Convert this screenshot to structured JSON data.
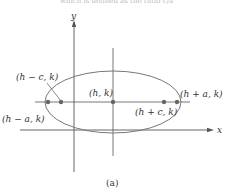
{
  "figure": {
    "top_text": "which is defined as the ratio c/a",
    "caption": "(a)",
    "axes": {
      "x_label": "x",
      "y_label": "y"
    },
    "points": [
      {
        "id": "left-vertex",
        "label": "(h − a, k)"
      },
      {
        "id": "left-focus",
        "label": "(h − c, k)"
      },
      {
        "id": "center",
        "label": "(h, k)"
      },
      {
        "id": "right-focus",
        "label": "(h + c, k)"
      },
      {
        "id": "right-vertex",
        "label": "(h + a, k)"
      }
    ],
    "colors": {
      "line": "#555555",
      "ellipse": "#777777",
      "point": "#666666"
    }
  }
}
